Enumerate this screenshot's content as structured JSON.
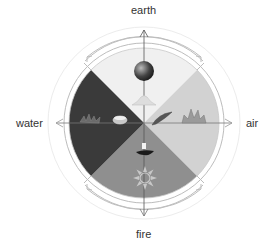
{
  "labels": {
    "top": "earth",
    "left": "water",
    "right": "air",
    "bottom": "fire"
  },
  "segments": [
    {
      "name": "earth",
      "position": "top",
      "color": "#f0f0f0",
      "symbol": "sphere-and-mound-icon"
    },
    {
      "name": "air",
      "position": "right",
      "color": "#d4d4d4",
      "symbol": "feather-and-lotus-icon"
    },
    {
      "name": "fire",
      "position": "bottom",
      "color": "#8e8e8e",
      "symbol": "lamp-and-sun-icon"
    },
    {
      "name": "water",
      "position": "left",
      "color": "#3c3c3c",
      "symbol": "bowl-and-plant-icon"
    }
  ],
  "colors": {
    "ring": "#bdbdbd",
    "axis": "#555555",
    "text": "#333333"
  }
}
